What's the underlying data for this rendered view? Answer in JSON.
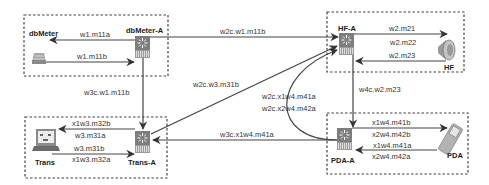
{
  "diagram": {
    "colors": {
      "line": "#444444",
      "switch_fill": "#7a7a7a",
      "device_fill": "#b0b0b0",
      "background": "#ffffff"
    },
    "groups": [
      {
        "id": "dbmeter-group",
        "device": "dbMeter",
        "switch": "dbMeter-A"
      },
      {
        "id": "hf-group",
        "device": "HF",
        "switch": "HF-A"
      },
      {
        "id": "trans-group",
        "device": "Trans",
        "switch": "Trans-A"
      },
      {
        "id": "pda-group",
        "device": "PDA",
        "switch": "PDA-A"
      }
    ],
    "nodes": {
      "dbmeter": {
        "label": "dbMeter",
        "icon": "meter-device-icon"
      },
      "dbmeter_a": {
        "label": "dbMeter-A",
        "icon": "switch-icon"
      },
      "hf": {
        "label": "HF",
        "icon": "speaker-icon"
      },
      "hf_a": {
        "label": "HF-A",
        "icon": "switch-icon"
      },
      "trans": {
        "label": "Trans",
        "icon": "laptop-icon"
      },
      "trans_a": {
        "label": "Trans-A",
        "icon": "switch-icon"
      },
      "pda": {
        "label": "PDA",
        "icon": "pda-icon"
      },
      "pda_a": {
        "label": "PDA-A",
        "icon": "switch-icon"
      }
    },
    "edges": {
      "dbmeter_a_to_dbmeter": "w1.m11a",
      "dbmeter_to_dbmeter_a": "w1.m11b",
      "dbmeter_a_to_hf_a": "w2c.w1.m11b",
      "dbmeter_a_to_trans_a": "w3c.w1.m11b",
      "hf_a_to_hf_1": "w2.m21",
      "hf_a_to_hf_2": "w2.m22",
      "hf_to_hf_a": "w2.m23",
      "hf_a_to_pda_a": "w4c.w2.m23",
      "trans_a_to_hf_a": "w2c.w3.m31b",
      "pda_a_to_hf_a_1": "w2c.x1w4.m41a",
      "pda_a_to_hf_a_2": "w2c.x2w4.m42a",
      "pda_a_to_trans_a": "w3c.x1w4.m41a",
      "trans_a_to_trans_1": "x1w3.m32b",
      "trans_a_to_trans_2": "w3.m31a",
      "trans_to_trans_a_1": "w3.m31b",
      "trans_to_trans_a_2": "x1w3.m32a",
      "pda_a_to_pda_1": "x1w4.m41b",
      "pda_a_to_pda_2": "x2w4.m42b",
      "pda_to_pda_a_1": "x1w4.m41a",
      "pda_to_pda_a_2": "x2w4.m42a"
    }
  }
}
